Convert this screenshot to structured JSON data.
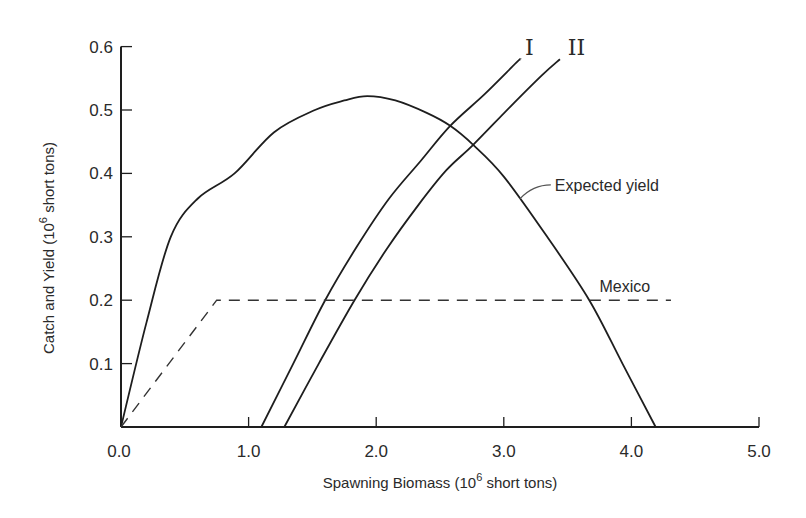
{
  "chart_data": {
    "type": "line",
    "title": "",
    "xlabel": "Spawning Biomass (10^6 short tons)",
    "xlabel_parts": {
      "pre": "Spawning Biomass (10",
      "sup": "6",
      "post": " short tons)"
    },
    "ylabel": "Catch and Yield (10^6 short tons)",
    "ylabel_parts": {
      "pre": "Catch and Yield (10",
      "sup": "6",
      "post": " short tons)"
    },
    "xlim": [
      0,
      5.0
    ],
    "ylim": [
      0,
      0.6
    ],
    "x_ticks": [
      {
        "value": 0,
        "label": "0.0"
      },
      {
        "value": 1,
        "label": "1.0"
      },
      {
        "value": 2,
        "label": "2.0"
      },
      {
        "value": 3,
        "label": "3.0"
      },
      {
        "value": 4,
        "label": "4.0"
      },
      {
        "value": 5,
        "label": "5.0"
      }
    ],
    "y_ticks": [
      {
        "value": 0.1,
        "label": "0.1"
      },
      {
        "value": 0.2,
        "label": "0.2"
      },
      {
        "value": 0.3,
        "label": "0.3"
      },
      {
        "value": 0.4,
        "label": "0.4"
      },
      {
        "value": 0.5,
        "label": "0.5"
      },
      {
        "value": 0.6,
        "label": "0.6"
      }
    ],
    "grid": false,
    "legend": "inline labels",
    "series": [
      {
        "name": "Expected yield",
        "style": "solid",
        "x": [
          0.0,
          0.2,
          0.39,
          0.6,
          0.89,
          1.2,
          1.52,
          1.75,
          1.93,
          2.15,
          2.4,
          2.58,
          2.76,
          3.0,
          3.34,
          3.67,
          3.93,
          4.19
        ],
        "y": [
          0.0,
          0.165,
          0.3,
          0.36,
          0.4,
          0.465,
          0.5,
          0.515,
          0.522,
          0.515,
          0.495,
          0.475,
          0.445,
          0.395,
          0.3,
          0.2,
          0.1,
          0.0
        ]
      },
      {
        "name": "I",
        "style": "solid",
        "x": [
          1.1,
          1.35,
          1.6,
          1.85,
          2.1,
          2.35,
          2.58,
          2.85,
          3.1,
          3.13
        ],
        "y": [
          0.0,
          0.1,
          0.2,
          0.285,
          0.36,
          0.42,
          0.475,
          0.525,
          0.575,
          0.58
        ]
      },
      {
        "name": "II",
        "style": "solid",
        "x": [
          1.28,
          1.55,
          1.83,
          2.08,
          2.33,
          2.55,
          2.76,
          3.05,
          3.3,
          3.44
        ],
        "y": [
          0.0,
          0.1,
          0.2,
          0.28,
          0.35,
          0.405,
          0.445,
          0.505,
          0.555,
          0.58
        ]
      },
      {
        "name": "Mexico",
        "style": "dashed",
        "x": [
          0.0,
          0.75,
          4.31
        ],
        "y": [
          0.0,
          0.2,
          0.2
        ]
      }
    ],
    "annotations": [
      {
        "text": "I",
        "x": 3.2,
        "y": 0.6,
        "target": "I"
      },
      {
        "text": "II",
        "x": 3.57,
        "y": 0.6,
        "target": "II"
      },
      {
        "text": "Expected yield",
        "x": 3.4,
        "y": 0.385,
        "target": "Expected yield",
        "leader": true
      },
      {
        "text": "Mexico",
        "x": 3.75,
        "y": 0.225,
        "target": "Mexico"
      }
    ]
  }
}
